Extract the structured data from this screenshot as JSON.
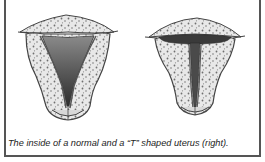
{
  "figure": {
    "caption": "The inside of a normal and a  “T”  shaped uterus (right).",
    "panels": [
      {
        "id": "normal",
        "label": "normal uterus",
        "cavity_shape": "triangular"
      },
      {
        "id": "t-shaped",
        "label": "T-shaped uterus",
        "cavity_shape": "T"
      }
    ],
    "colors": {
      "border": "#555555",
      "tissue_fill": "#e6e6e6",
      "tissue_outline": "#444444",
      "cavity": "#5a5a5a",
      "speckle": "#6f6f6f"
    }
  }
}
